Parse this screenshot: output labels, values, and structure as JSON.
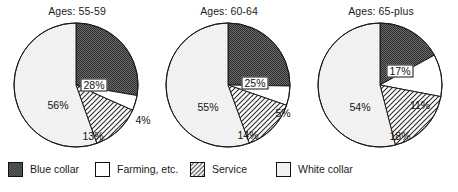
{
  "figure": {
    "background": "#ffffff",
    "text_color": "#1a1a1a"
  },
  "legend": {
    "items": [
      {
        "label": "Blue collar",
        "pattern": "checker-dark",
        "color": "#3a3a3a"
      },
      {
        "label": "Farming, etc.",
        "pattern": "solid-white",
        "color": "#ffffff"
      },
      {
        "label": "Service",
        "pattern": "diagonal-hatch",
        "color": "#ffffff"
      },
      {
        "label": "White collar",
        "pattern": "solid-light",
        "color": "#e8e8e8"
      }
    ]
  },
  "chart_data": [
    {
      "type": "pie",
      "title": "Ages: 55-59",
      "categories": [
        "Blue collar",
        "Farming, etc.",
        "Service",
        "White collar"
      ],
      "values": [
        28,
        4,
        13,
        56
      ],
      "labels": [
        "28%",
        "4%",
        "13%",
        "56%"
      ],
      "label_boxed": [
        true,
        false,
        false,
        false
      ],
      "label_positions": [
        {
          "x": 82,
          "y": 64
        },
        {
          "x": 131,
          "y": 99
        },
        {
          "x": 81,
          "y": 115
        },
        {
          "x": 46,
          "y": 84
        }
      ],
      "start_angle_deg": 0,
      "direction": "clockwise",
      "legend_position": "bottom"
    },
    {
      "type": "pie",
      "title": "Ages: 60-64",
      "categories": [
        "Blue collar",
        "Farming, etc.",
        "Service",
        "White collar"
      ],
      "values": [
        25,
        5,
        14,
        55
      ],
      "labels": [
        "25%",
        "5%",
        "14%",
        "55%"
      ],
      "label_boxed": [
        true,
        false,
        false,
        false
      ],
      "label_positions": [
        {
          "x": 91,
          "y": 62
        },
        {
          "x": 119,
          "y": 92
        },
        {
          "x": 84,
          "y": 114
        },
        {
          "x": 44,
          "y": 86
        }
      ],
      "start_angle_deg": 0,
      "direction": "clockwise",
      "legend_position": "bottom"
    },
    {
      "type": "pie",
      "title": "Ages: 65-plus",
      "categories": [
        "Blue collar",
        "Farming, etc.",
        "Service",
        "White collar"
      ],
      "values": [
        17,
        11,
        18,
        54
      ],
      "labels": [
        "17%",
        "11%",
        "18%",
        "54%"
      ],
      "label_boxed": [
        true,
        false,
        false,
        false
      ],
      "label_positions": [
        {
          "x": 84,
          "y": 50
        },
        {
          "x": 104,
          "y": 84
        },
        {
          "x": 84,
          "y": 115
        },
        {
          "x": 44,
          "y": 86
        }
      ],
      "start_angle_deg": 0,
      "direction": "clockwise",
      "legend_position": "bottom"
    }
  ]
}
